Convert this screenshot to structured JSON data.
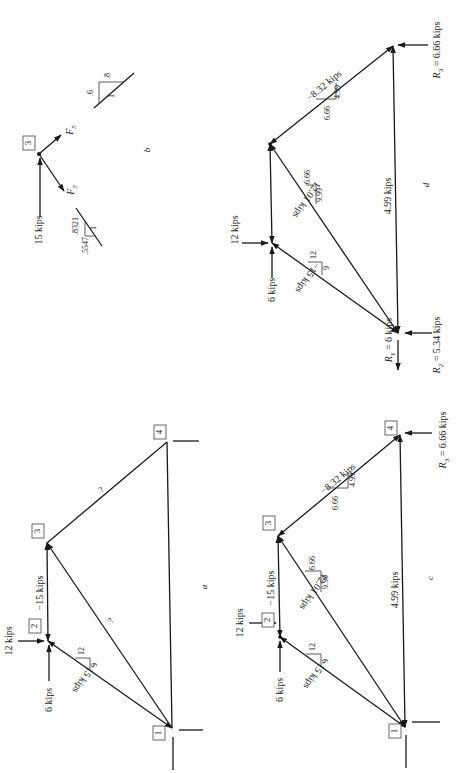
{
  "page": {
    "orientation": "rotated-90-ccw",
    "background": "#ffffff",
    "ink": "#1a1a1a"
  },
  "panels": {
    "a": {
      "caption": "a",
      "nodes": {
        "1": "1",
        "2": "2",
        "3": "3",
        "4": "4"
      },
      "loads": {
        "horizontal": "12 kips",
        "vertical": "6 kips"
      },
      "members": {
        "m12": "−15 kips",
        "m23": "−15 kips",
        "m13": "?",
        "m34": "?"
      },
      "slope_12": {
        "rise": "12",
        "run": "9"
      }
    },
    "b": {
      "caption": "b",
      "node": "3",
      "load": "15 kips",
      "forces": {
        "f5": "F",
        "f5_sub": "5",
        "f3": "F",
        "f3_sub": "3"
      },
      "slope_top": {
        "a": ".6",
        "b": ".8",
        "hyp": "1"
      },
      "slope_bottom": {
        "a": ".5547",
        "b": ".8321",
        "hyp": "1"
      }
    },
    "c": {
      "caption": "c",
      "nodes": {
        "1": "1",
        "2": "2",
        "3": "3",
        "4": "4"
      },
      "loads": {
        "horizontal": "12 kips",
        "vertical": "6 kips"
      },
      "members": {
        "m12": "−15 kips",
        "m23": "−15 kips",
        "m13": "12.01 kips",
        "m34": "−8.32 kips",
        "m14": "4.99 kips"
      },
      "slope_12": {
        "rise": "12",
        "run": "9"
      },
      "slope_13": {
        "rise": "6.66",
        "run": "9.99"
      },
      "slope_34": {
        "rise": "6.66",
        "run": "4.99"
      },
      "reaction_r3": {
        "symbol": "R",
        "sub": "3",
        "value": " = 6.66 kips"
      }
    },
    "d": {
      "caption": "d",
      "loads": {
        "horizontal": "12 kips",
        "vertical": "6 kips"
      },
      "members": {
        "m12": "−15 kips",
        "m13": "12.01 kips",
        "m34": "−8.32 kips",
        "m14": "4.99 kips"
      },
      "slope_12": {
        "rise": "12",
        "run": "9"
      },
      "slope_13": {
        "rise": "6.66",
        "run": "9.99"
      },
      "slope_34": {
        "rise": "6.66",
        "run": "4.99"
      },
      "reaction_r1": {
        "symbol": "R",
        "sub": "1",
        "value": " = 6 kips"
      },
      "reaction_r2": {
        "symbol": "R",
        "sub": "2",
        "value": " = 5.34 kips"
      },
      "reaction_r3": {
        "symbol": "R",
        "sub": "3",
        "value": " = 6.66 kips"
      }
    }
  }
}
